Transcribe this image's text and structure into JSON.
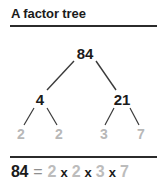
{
  "title": "A factor tree",
  "colors": {
    "ink": "#1b1b1b",
    "rule": "#2b2b2b",
    "leaf_gray": "#b8b8b8",
    "factor_gray": "#bcbcbc",
    "equals_gray": "#8f8f8f",
    "line": "#3a3a3a",
    "background": "#ffffff"
  },
  "tree": {
    "root": {
      "label": "84"
    },
    "level1": [
      {
        "label": "4"
      },
      {
        "label": "21"
      }
    ],
    "leaves": [
      {
        "label": "2"
      },
      {
        "label": "2"
      },
      {
        "label": "3"
      },
      {
        "label": "7"
      }
    ]
  },
  "equation": {
    "lhs": "84",
    "equals": "=",
    "factors": [
      "2",
      "2",
      "3",
      "7"
    ],
    "operator": "x"
  }
}
